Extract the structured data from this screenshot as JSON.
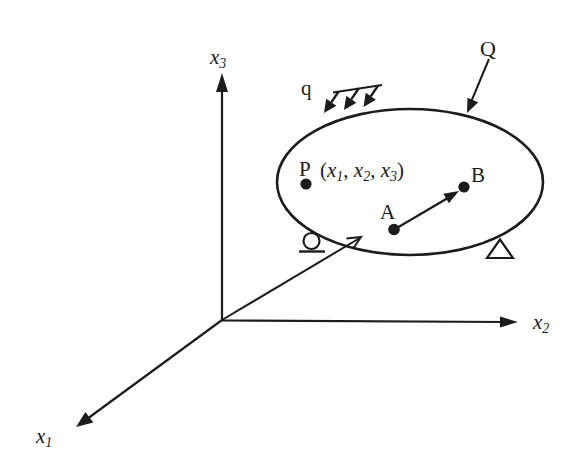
{
  "colors": {
    "ink": "#1c1c1c",
    "background": "#ffffff"
  },
  "axes": {
    "x1": {
      "base": "x",
      "sub": "1"
    },
    "x2": {
      "base": "x",
      "sub": "2"
    },
    "x3": {
      "base": "x",
      "sub": "3"
    }
  },
  "loads": {
    "distributed_label": "q",
    "point_label": "Q"
  },
  "points": {
    "P": {
      "label": "P"
    },
    "A": {
      "label": "A"
    },
    "B": {
      "label": "B"
    },
    "coords": {
      "open": "(",
      "x1": "x",
      "sub1": "1",
      "sep1": ", ",
      "x2": "x",
      "sub2": "2",
      "sep2": ", ",
      "x3": "x",
      "sub3": "3",
      "close": ")"
    }
  }
}
